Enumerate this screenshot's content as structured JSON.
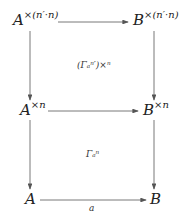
{
  "nodes": {
    "top_left": {
      "base": "A",
      "exp": "×(n′·n)"
    },
    "top_right": {
      "base": "B",
      "exp": "×(n′·n)"
    },
    "mid_left": {
      "base": "A",
      "exp": "×n"
    },
    "mid_right": {
      "base": "B",
      "exp": "×n"
    },
    "bot_left": {
      "base": "A",
      "exp": ""
    },
    "bot_right": {
      "base": "B",
      "exp": ""
    }
  },
  "labels": {
    "upper_square": "(Γₐⁿ′)×ⁿ",
    "lower_square": "Γₐⁿ",
    "bottom_arrow": "a"
  },
  "colors": {
    "arrow": "#555555",
    "text": "#222222"
  }
}
